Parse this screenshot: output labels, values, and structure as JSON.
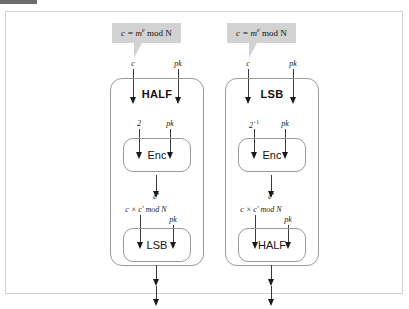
{
  "caption": {
    "swatch_color": "#6d6d6d",
    "text": ""
  },
  "figure": {
    "background": "#ffffff",
    "border_color": "#d2d2d2",
    "bubble_color": "#d2d2d2",
    "arrow_color": "#1a1a1a",
    "box_border_color": "#9a9a9a"
  },
  "columns": [
    {
      "id": "half-to-lsb",
      "bubble": {
        "formula": "c = m",
        "exponent": "e",
        "suffix": " mod N"
      },
      "top_inputs": [
        {
          "name": "ciphertext",
          "label": "c"
        },
        {
          "name": "public-key",
          "label": "pk"
        }
      ],
      "title": "HALF",
      "enc_inputs": [
        {
          "name": "multiplier",
          "label": "2"
        },
        {
          "name": "public-key",
          "label": "pk"
        }
      ],
      "enc_label": "Enc",
      "enc_output": "c'",
      "out_inputs": [
        {
          "name": "product",
          "label": "c × c' mod N"
        },
        {
          "name": "public-key",
          "label": "pk"
        }
      ],
      "out_label": "LSB"
    },
    {
      "id": "lsb-to-half",
      "bubble": {
        "formula": "c = m",
        "exponent": "e",
        "suffix": " mod N"
      },
      "top_inputs": [
        {
          "name": "ciphertext",
          "label": "c"
        },
        {
          "name": "public-key",
          "label": "pk"
        }
      ],
      "title": "LSB",
      "enc_inputs": [
        {
          "name": "inverse-multiplier",
          "label": "2",
          "sup": "−1"
        },
        {
          "name": "public-key",
          "label": "pk"
        }
      ],
      "enc_label": "Enc",
      "enc_output": "c'",
      "out_inputs": [
        {
          "name": "product",
          "label": "c × c' mod N"
        },
        {
          "name": "public-key",
          "label": "pk"
        }
      ],
      "out_label": "HALF"
    }
  ]
}
